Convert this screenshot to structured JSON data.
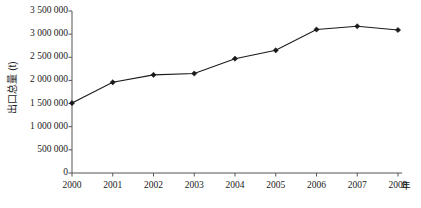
{
  "chart_data": {
    "type": "line",
    "title": "",
    "xlabel": "年",
    "ylabel": "出口总量 (t)",
    "categories": [
      "2000",
      "2001",
      "2002",
      "2003",
      "2004",
      "2005",
      "2006",
      "2007",
      "2008"
    ],
    "x": [
      2000,
      2001,
      2002,
      2003,
      2004,
      2005,
      2006,
      2007,
      2008
    ],
    "values": [
      1510000,
      1960000,
      2120000,
      2150000,
      2470000,
      2650000,
      3100000,
      3170000,
      3090000
    ],
    "series": [
      {
        "name": "出口总量",
        "values": [
          1510000,
          1960000,
          2120000,
          2150000,
          2470000,
          2650000,
          3100000,
          3170000,
          3090000
        ]
      }
    ],
    "ylim": [
      0,
      3500000
    ],
    "yticks": [
      0,
      500000,
      1000000,
      1500000,
      2000000,
      2500000,
      3000000,
      3500000
    ],
    "ytick_labels": [
      "0",
      "500 000",
      "1 000 000",
      "1 500 000",
      "2 000 000",
      "2 500 000",
      "3 000 000",
      "3 500 000"
    ],
    "xtick_labels": [
      "2000",
      "2001",
      "2002",
      "2003",
      "2004",
      "2005",
      "2006",
      "2007",
      "2008"
    ],
    "grid": false,
    "legend": "none",
    "marker": "diamond",
    "line_color": "#1a1a1a",
    "marker_color": "#1a1a1a",
    "axis_color": "#555555",
    "background": "#ffffff"
  },
  "axes": {
    "y_title": "出口总量 (t)",
    "x_unit": "年"
  }
}
